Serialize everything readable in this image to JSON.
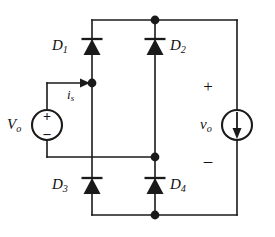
{
  "figure": {
    "type": "circuit-schematic",
    "background_color": "#ffffff",
    "line_color": "#1a1a1a",
    "width": 275,
    "height": 237
  },
  "components": {
    "diodes": [
      {
        "id": "D1",
        "name": "D",
        "subscript": "1",
        "label_side": "left",
        "orientation": "up",
        "x": 92,
        "y": 47
      },
      {
        "id": "D2",
        "name": "D",
        "subscript": "2",
        "label_side": "right",
        "orientation": "up",
        "x": 155,
        "y": 47
      },
      {
        "id": "D3",
        "name": "D",
        "subscript": "3",
        "label_side": "left",
        "orientation": "up",
        "x": 92,
        "y": 186
      },
      {
        "id": "D4",
        "name": "D",
        "subscript": "4",
        "label_side": "right",
        "orientation": "up",
        "x": 155,
        "y": 186
      }
    ],
    "voltage_source": {
      "id": "Vo",
      "name": "V",
      "subscript": "o",
      "plus": "+",
      "minus": "–",
      "shape": "circle",
      "x": 47,
      "y": 125
    },
    "current_source": {
      "id": "vo",
      "name": "v",
      "subscript": "o",
      "plus": "+",
      "minus": "–",
      "shape": "circle-arrow",
      "arrow_direction": "down",
      "x": 237,
      "y": 125
    },
    "current_arrow": {
      "id": "is",
      "name": "i",
      "subscript": "s",
      "direction": "right",
      "x": 78,
      "y": 83
    },
    "nodes": [
      {
        "id": "node-top",
        "x": 155,
        "y": 20
      },
      {
        "id": "node-mid",
        "x": 155,
        "y": 157
      },
      {
        "id": "node-bottom",
        "x": 155,
        "y": 215
      },
      {
        "id": "node-source",
        "x": 92,
        "y": 83
      }
    ]
  },
  "labels": {
    "d1": "D",
    "d1_sub": "1",
    "d2": "D",
    "d2_sub": "2",
    "d3": "D",
    "d3_sub": "3",
    "d4": "D",
    "d4_sub": "4",
    "vsource": "V",
    "vsource_sub": "o",
    "vout": "v",
    "vout_sub": "o",
    "isource": "i",
    "isource_sub": "s",
    "plus_vsource": "+",
    "minus_vsource": "–",
    "plus_vout": "+",
    "minus_vout": "–"
  }
}
